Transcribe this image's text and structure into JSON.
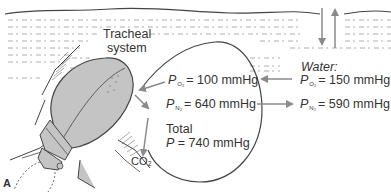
{
  "figure": {
    "panel_label": "A",
    "labels": {
      "tracheal_line1": "Tracheal",
      "tracheal_line2": "system",
      "bubble": {
        "po2_symbol": "P",
        "po2_sub": "O₂",
        "po2_value": "= 100 mmHg",
        "pn2_symbol": "P",
        "pn2_sub": "N₂",
        "pn2_value": "= 640 mmHg",
        "total_line1": "Total",
        "total_symbol": "P",
        "total_value": "= 740 mmHg"
      },
      "water": {
        "title": "Water:",
        "po2_symbol": "P",
        "po2_sub": "O₂",
        "po2_value": "= 150 mmHg",
        "pn2_symbol": "P",
        "pn2_sub": "N₂",
        "pn2_value": "= 590 mmHg"
      },
      "co2": "CO₂"
    },
    "arrows": [
      {
        "name": "o2-water-to-bubble",
        "direction": "left"
      },
      {
        "name": "n2-bubble-to-water",
        "direction": "right"
      },
      {
        "name": "o2-bubble-to-beetle",
        "direction": "down-left"
      },
      {
        "name": "bubble-to-beetle-flow",
        "direction": "down-right"
      },
      {
        "name": "co2-out",
        "direction": "down"
      },
      {
        "name": "surface-exchange-down",
        "direction": "down"
      },
      {
        "name": "surface-exchange-up",
        "direction": "up"
      }
    ],
    "colors": {
      "line": "#444444",
      "beetle_fill": "#c4c4c4",
      "arrow": "#8a8a8a",
      "text": "#333333",
      "water_dash": "#9a9a9a"
    }
  }
}
